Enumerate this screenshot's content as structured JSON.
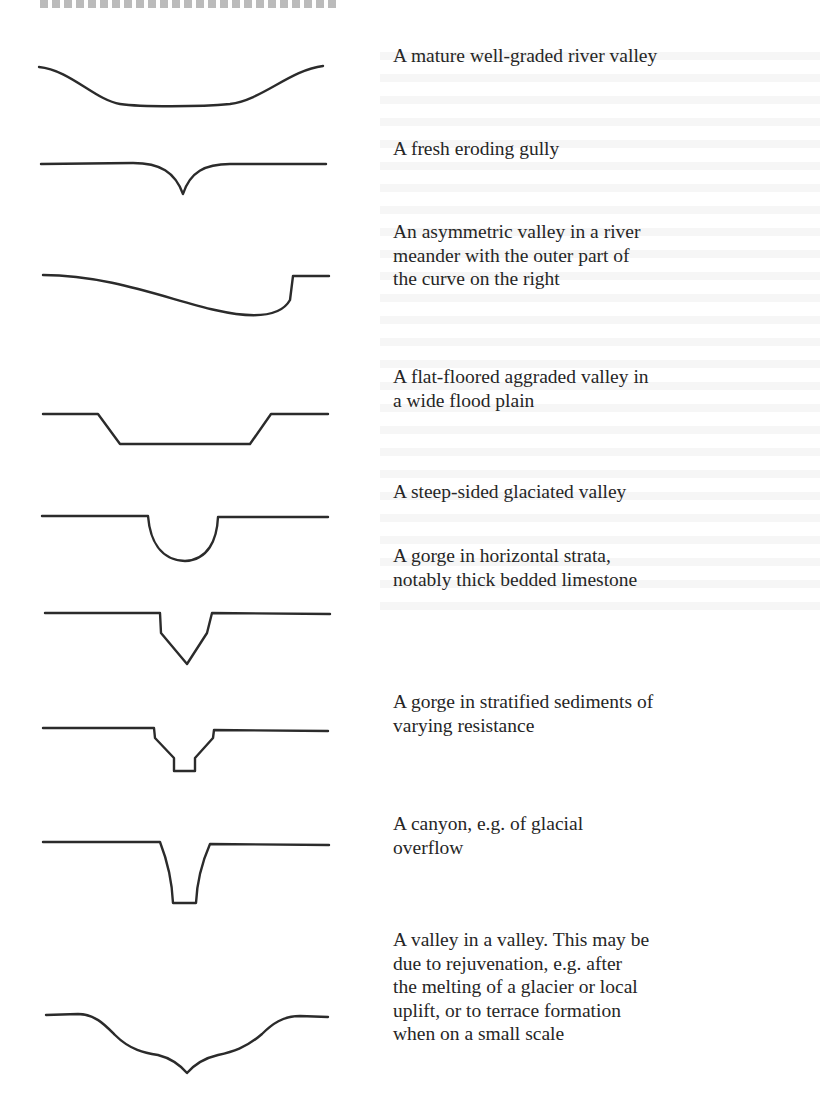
{
  "figure": {
    "items": [
      {
        "id": "mature-river-valley",
        "caption": "A mature well-graded river valley"
      },
      {
        "id": "fresh-eroding-gully",
        "caption": "A fresh eroding gully"
      },
      {
        "id": "asymmetric-meander-valley",
        "caption": "An asymmetric valley in a river\nmeander with the outer part of\nthe curve on the right"
      },
      {
        "id": "flat-floored-aggraded-valley",
        "caption": "A flat-floored aggraded valley in\na wide flood plain"
      },
      {
        "id": "steep-sided-glaciated-valley",
        "caption": "A steep-sided glaciated valley"
      },
      {
        "id": "gorge-horizontal-strata",
        "caption": "A gorge in horizontal strata,\nnotably thick bedded limestone"
      },
      {
        "id": "gorge-stratified-sediments",
        "caption": "A gorge in stratified sediments of\nvarying resistance"
      },
      {
        "id": "glacial-overflow-canyon",
        "caption": "A canyon, e.g. of glacial\noverflow"
      },
      {
        "id": "valley-in-a-valley",
        "caption": "A valley in a valley. This may be\ndue to rejuvenation, e.g. after\nthe melting of a glacier or local\nuplift, or to terrace formation\nwhen on a small scale"
      }
    ]
  }
}
